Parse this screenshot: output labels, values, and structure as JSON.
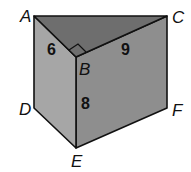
{
  "figure": {
    "type": "triangular-prism",
    "vertices": {
      "A": {
        "label": "A",
        "x": 34,
        "y": 16
      },
      "B": {
        "label": "B",
        "x": 76,
        "y": 57
      },
      "C": {
        "label": "C",
        "x": 167,
        "y": 16
      },
      "D": {
        "label": "D",
        "x": 34,
        "y": 108
      },
      "E": {
        "label": "E",
        "x": 76,
        "y": 148
      },
      "F": {
        "label": "F",
        "x": 167,
        "y": 108
      }
    },
    "measurements": {
      "AB": "6",
      "BC": "9",
      "BE": "8"
    },
    "right_angle_at": "B",
    "colors": {
      "top_face": "#6e6e6e",
      "left_face": "#a6a6a6",
      "right_face": "#8e8e8e",
      "edge": "#111111"
    }
  }
}
